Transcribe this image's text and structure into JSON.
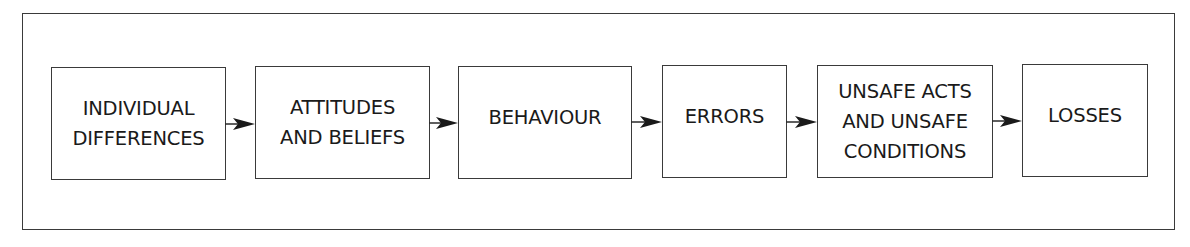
{
  "diagram": {
    "type": "flow",
    "direction": "left-to-right",
    "nodes": [
      {
        "id": "n1",
        "label": "INDIVIDUAL\nDIFFERENCES"
      },
      {
        "id": "n2",
        "label": "ATTITUDES\nAND BELIEFS"
      },
      {
        "id": "n3",
        "label": "BEHAVIOUR"
      },
      {
        "id": "n4",
        "label": "ERRORS"
      },
      {
        "id": "n5",
        "label": "UNSAFE ACTS\nAND UNSAFE\nCONDITIONS"
      },
      {
        "id": "n6",
        "label": "LOSSES"
      }
    ],
    "edges": [
      {
        "from": "n1",
        "to": "n2"
      },
      {
        "from": "n2",
        "to": "n3"
      },
      {
        "from": "n3",
        "to": "n4"
      },
      {
        "from": "n4",
        "to": "n5"
      },
      {
        "from": "n5",
        "to": "n6"
      }
    ],
    "colors": {
      "stroke": "#3a3a3a",
      "text": "#1a1a1a",
      "background": "#ffffff"
    }
  }
}
